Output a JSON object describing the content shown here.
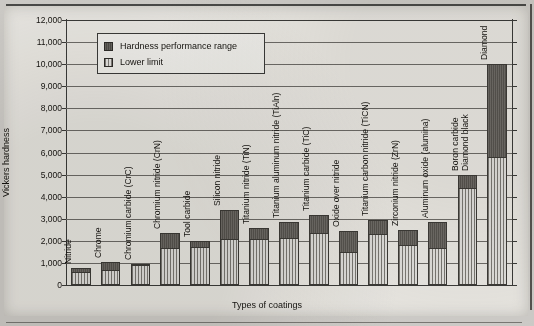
{
  "chart_data": {
    "type": "bar",
    "title": "",
    "xlabel": "Types of coatings",
    "ylabel": "Vickers hardness",
    "ylim": [
      0,
      12000
    ],
    "yticks": [
      "0",
      "1,000",
      "2,000",
      "3,000",
      "4,000",
      "5,000",
      "6,000",
      "7,000",
      "8,000",
      "9,000",
      "10,000",
      "11,000",
      "12,000"
    ],
    "grid": true,
    "stacked": true,
    "legend_position": "top-left-inside",
    "legend": [
      {
        "label": "Hardness performance range",
        "swatch": "dark"
      },
      {
        "label": "Lower limit",
        "swatch": "light"
      }
    ],
    "categories": [
      "Nitride",
      "Chrome",
      "Chromium carbide (CrC)",
      "Chromium nitride (CrN)",
      "Tool carbide",
      "Silicon nitride",
      "Titanium nitride (TiN)",
      "Titanium aluminum nitride (TiAln)",
      "Titanium carbide (TiC)",
      "Oxide over nitride",
      "Titanium carbon nitride (TiCN)",
      "Zirconium nitride (ZrN)",
      "Aluminum oxide (alumina)",
      "Boron carbide\nDiamond black",
      "Diamond"
    ],
    "series": [
      {
        "name": "Lower limit",
        "values": [
          500,
          600,
          800,
          1600,
          1650,
          2000,
          2000,
          2050,
          2250,
          1400,
          2200,
          1700,
          1600,
          4300,
          5700
        ]
      },
      {
        "name": "Hardness performance range",
        "values": [
          250,
          450,
          150,
          750,
          350,
          1400,
          600,
          800,
          900,
          1050,
          750,
          800,
          1250,
          700,
          4300
        ]
      }
    ],
    "totals": [
      750,
      1050,
      950,
      2350,
      2000,
      3400,
      2600,
      2850,
      3150,
      2450,
      2950,
      2500,
      2850,
      5000,
      10000
    ]
  }
}
